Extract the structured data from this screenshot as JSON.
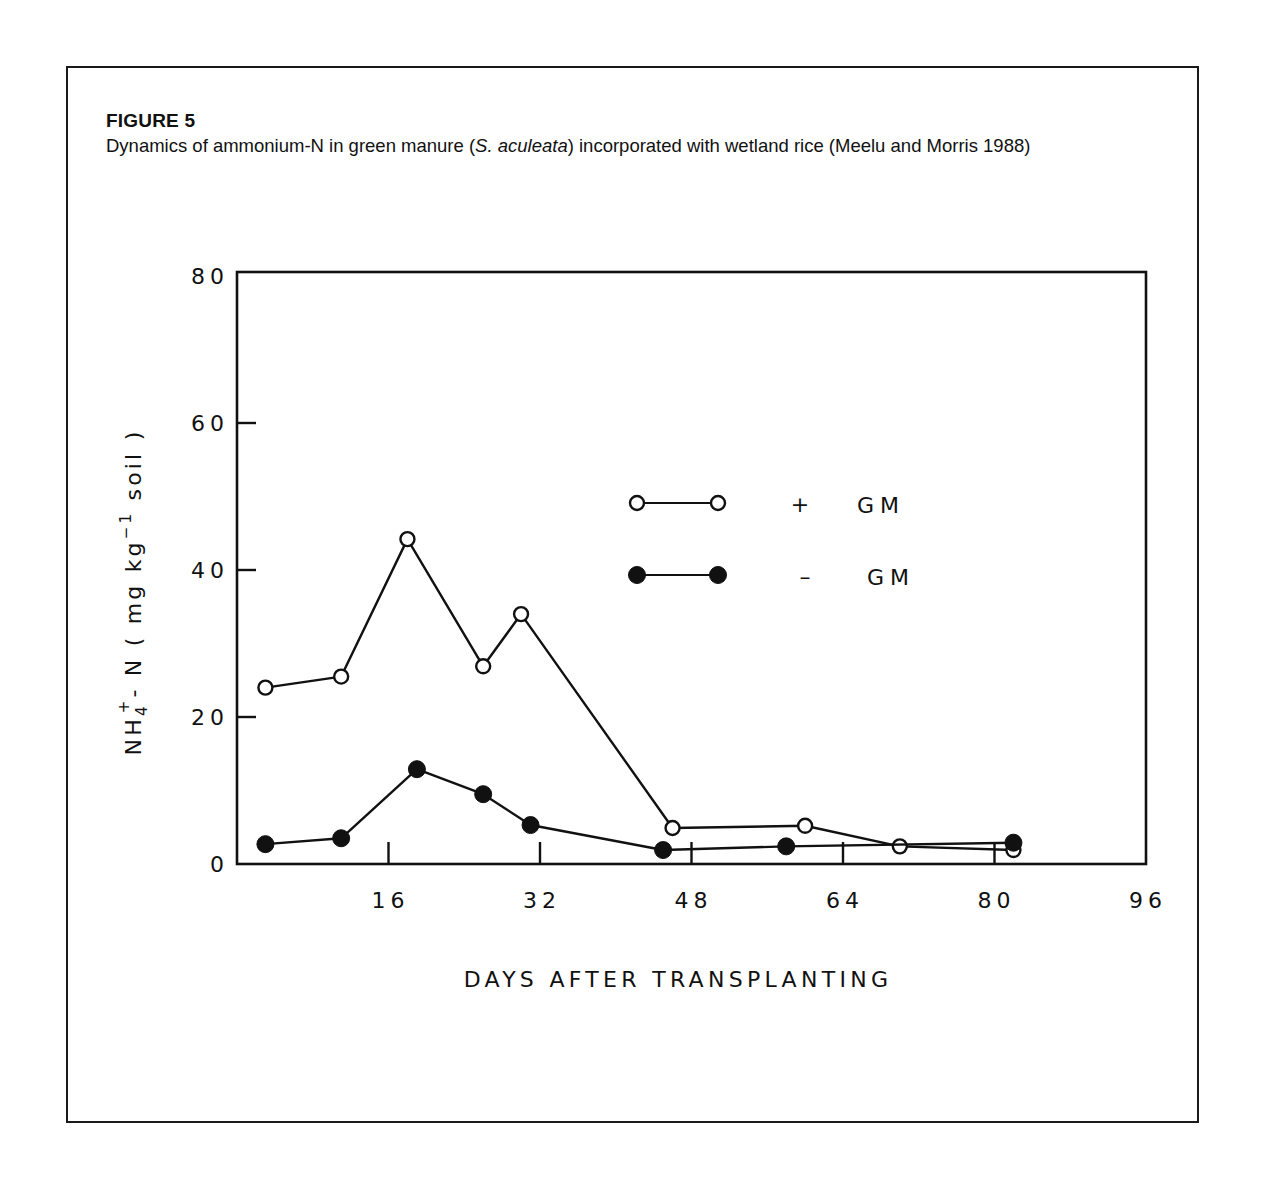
{
  "figure": {
    "label": "FIGURE 5",
    "caption_pre": "Dynamics of ammonium-N in green manure (",
    "caption_italic": "S. aculeata",
    "caption_post": ") incorporated with wetland rice (Meelu and Morris 1988)"
  },
  "colors": {
    "ink": "#111111",
    "background": "#ffffff"
  },
  "chart_data": {
    "type": "line",
    "title": "Dynamics of ammonium-N in green manure (S. aculeata) incorporated with wetland rice (Meelu and Morris 1988)",
    "xlabel": "DAYS AFTER TRANSPLANTING",
    "ylabel": "NH4+ - N ( mg kg-1 soil )",
    "xlim": [
      0,
      96
    ],
    "ylim": [
      0,
      80
    ],
    "x_ticks": [
      16,
      32,
      48,
      64,
      80,
      96
    ],
    "x_tick_labels": [
      "16",
      "32",
      "48",
      "64",
      "80",
      "96"
    ],
    "y_ticks": [
      0,
      20,
      40,
      60,
      80
    ],
    "y_tick_labels": [
      "0",
      "20",
      "40",
      "60",
      "80"
    ],
    "grid": false,
    "legend_position": "upper-center inside plot",
    "series": [
      {
        "name": "+ GM",
        "marker": "open-circle",
        "x": [
          3,
          11,
          18,
          26,
          30,
          46,
          60,
          70,
          82
        ],
        "y": [
          24,
          25.5,
          44.2,
          26.9,
          34,
          4.9,
          5.2,
          2.4,
          1.9
        ]
      },
      {
        "name": "- GM",
        "marker": "filled-circle",
        "x": [
          3,
          11,
          19,
          26,
          31,
          45,
          58,
          82
        ],
        "y": [
          2.7,
          3.5,
          12.9,
          9.5,
          5.3,
          1.9,
          2.4,
          2.9
        ]
      }
    ]
  },
  "legend": {
    "items": [
      {
        "sign": "+",
        "label": "GM"
      },
      {
        "sign": "–",
        "label": "GM"
      }
    ]
  },
  "axes": {
    "x_title": "DAYS AFTER TRANSPLANTING",
    "y_title_base": "NH",
    "y_title_sub": "4",
    "y_title_sup": "+",
    "y_title_mid": "- N ( mg kg",
    "y_title_exp": "−1",
    "y_title_end": " soil )"
  }
}
